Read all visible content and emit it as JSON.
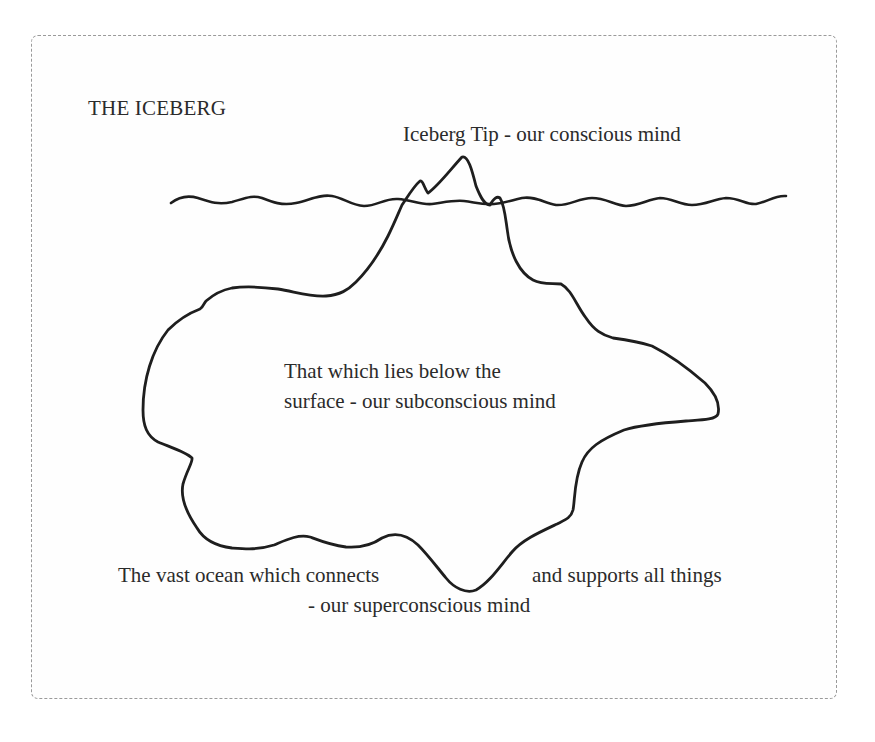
{
  "diagram": {
    "title": "THE ICEBERG",
    "labels": {
      "tip": "Iceberg Tip - our conscious mind",
      "subconscious_line1": "That which lies below the",
      "subconscious_line2": "surface - our subconscious mind",
      "ocean_left": "The vast ocean which connects",
      "ocean_right": "and supports all things",
      "ocean_bottom": "- our superconscious mind"
    },
    "colors": {
      "line": "#1e1e1e",
      "text": "#2b2b2b",
      "frame_border": "#9a9a9a",
      "background": "#ffffff"
    },
    "shapes": [
      {
        "name": "waterline",
        "type": "wavy-line"
      },
      {
        "name": "iceberg-outline",
        "type": "closed-freeform"
      }
    ]
  }
}
